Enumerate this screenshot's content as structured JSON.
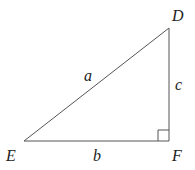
{
  "diagram": {
    "type": "right-triangle",
    "vertices": {
      "D": "D",
      "E": "E",
      "F": "F"
    },
    "sides": {
      "a": "a",
      "b": "b",
      "c": "c"
    },
    "right_angle_at": "F",
    "stroke_color": "#555555"
  }
}
